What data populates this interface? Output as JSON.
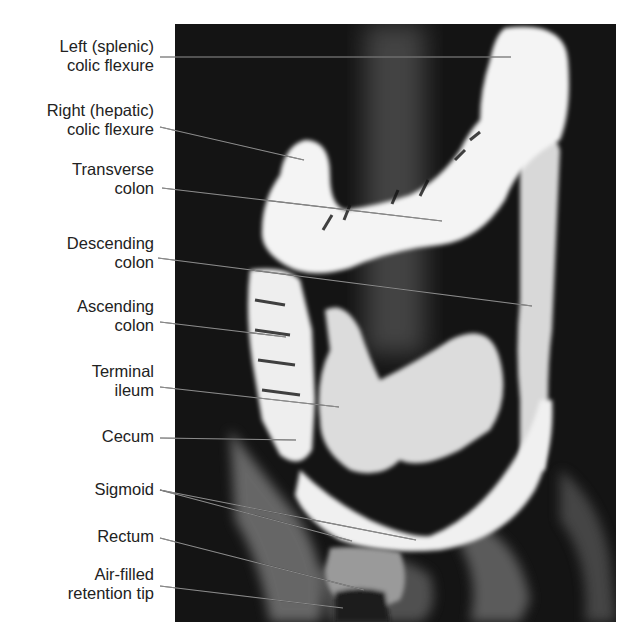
{
  "figure": {
    "labels": [
      {
        "id": "left-splenic-flexure",
        "lines": [
          "Left (splenic)",
          "colic flexure"
        ]
      },
      {
        "id": "right-hepatic-flexure",
        "lines": [
          "Right (hepatic)",
          "colic flexure"
        ]
      },
      {
        "id": "transverse-colon",
        "lines": [
          "Transverse",
          "colon"
        ]
      },
      {
        "id": "descending-colon",
        "lines": [
          "Descending",
          "colon"
        ]
      },
      {
        "id": "ascending-colon",
        "lines": [
          "Ascending",
          "colon"
        ]
      },
      {
        "id": "terminal-ileum",
        "lines": [
          "Terminal",
          "ileum"
        ]
      },
      {
        "id": "cecum",
        "lines": [
          "Cecum"
        ]
      },
      {
        "id": "sigmoid",
        "lines": [
          "Sigmoid"
        ]
      },
      {
        "id": "rectum",
        "lines": [
          "Rectum"
        ]
      },
      {
        "id": "air-filled-retention-tip",
        "lines": [
          "Air-filled",
          "retention tip"
        ]
      }
    ]
  }
}
